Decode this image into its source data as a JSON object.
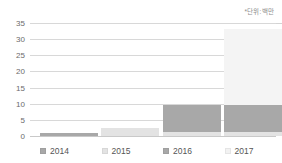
{
  "annotation": {
    "unit_note": "*단위:백만"
  },
  "chart_data": {
    "type": "bar",
    "title": "",
    "subtitle": "",
    "xlabel": "",
    "ylabel": "",
    "unit_note": "*단위:백만",
    "grid": true,
    "legend_position": "bottom",
    "ylim": [
      0,
      35
    ],
    "yticks": [
      0,
      5,
      10,
      15,
      20,
      25,
      30,
      35
    ],
    "ytick_labels": [
      "0",
      "5",
      "10",
      "15",
      "20",
      "25",
      "30",
      "35"
    ],
    "categories": [
      "2014",
      "2015",
      "2016",
      "2017"
    ],
    "stacked": true,
    "series": [
      {
        "name": "base",
        "color": "#e3e3e3",
        "values": [
          0.0,
          2.5,
          1.2,
          1.2
        ]
      },
      {
        "name": "mid",
        "color": "#a8a8a8",
        "values": [
          0.8,
          0.0,
          8.4,
          8.4
        ]
      },
      {
        "name": "top",
        "color": "#f4f4f4",
        "values": [
          0.0,
          0.0,
          0.0,
          23.4
        ]
      }
    ],
    "totals": [
      0.8,
      2.5,
      9.6,
      33.0
    ]
  },
  "legend": {
    "items": [
      {
        "label": "2014",
        "color": "#a8a8a8"
      },
      {
        "label": "2015",
        "color": "#e3e3e3"
      },
      {
        "label": "2016",
        "color": "#a8a8a8"
      },
      {
        "label": "2017",
        "color": "#f2f2f2"
      }
    ]
  },
  "colors": {
    "gridline": "#d8d8d8",
    "axis_text": "#6b6b6b",
    "dark_bar": "#a8a8a8",
    "light_bar": "#e3e3e3",
    "pale_bar": "#f4f4f4",
    "background": "#ffffff"
  }
}
